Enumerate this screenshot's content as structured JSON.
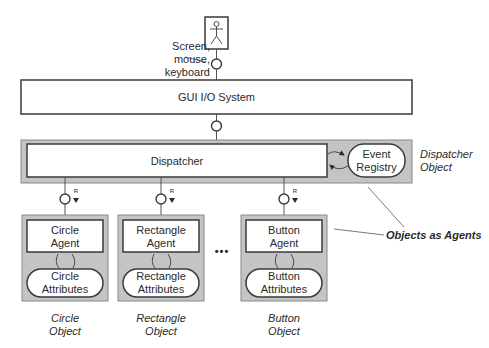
{
  "diagram": {
    "user": {
      "icon": "stick-figure-icon"
    },
    "screen_label": {
      "line1": "Screen,",
      "line2": "mouse, keyboard"
    },
    "gui_io": {
      "label": "GUI I/O System"
    },
    "dispatcher": {
      "label": "Dispatcher",
      "registry": {
        "line1": "Event",
        "line2": "Registry"
      },
      "object_label": {
        "line1": "Dispatcher",
        "line2": "Object"
      }
    },
    "port_marker": "R",
    "objects": [
      {
        "agent1": "Circle",
        "agent2": "Agent",
        "attr1": "Circle",
        "attr2": "Attributes",
        "obj1": "Circle",
        "obj2": "Object"
      },
      {
        "agent1": "Rectangle",
        "agent2": "Agent",
        "attr1": "Rectangle",
        "attr2": "Attributes",
        "obj1": "Rectangle",
        "obj2": "Object"
      },
      {
        "agent1": "Button",
        "agent2": "Agent",
        "attr1": "Button",
        "attr2": "Attributes",
        "obj1": "Button",
        "obj2": "Object"
      }
    ],
    "ellipsis": "•••",
    "callout": "Objects as Agents",
    "colors": {
      "object_fill": "#c4c4c4",
      "stroke": "#3a3a3a",
      "box_fill": "#ffffff"
    }
  }
}
